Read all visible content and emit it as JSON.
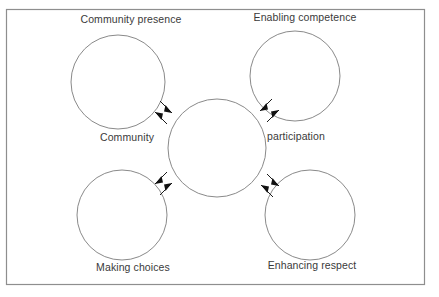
{
  "diagram": {
    "frame": {
      "name": "outer-border",
      "x": 6,
      "y": 9,
      "width": 419,
      "height": 276,
      "stroke": "#8e8e8e",
      "fill": "#ffffff"
    },
    "center_node": {
      "name": "central-circle",
      "label_left": "Community",
      "label_right": "participation",
      "cx": 217,
      "cy": 148,
      "r": 49
    },
    "nodes": [
      {
        "id": "community-presence",
        "label": "Community presence",
        "cx": 118,
        "cy": 82,
        "r": 47,
        "label_x": 118,
        "label_y": 13,
        "position": "top-left"
      },
      {
        "id": "enabling-competence",
        "label": "Enabling competence",
        "cx": 295,
        "cy": 76,
        "r": 45,
        "label_x": 305,
        "label_y": 11,
        "position": "top-right"
      },
      {
        "id": "making-choices",
        "label": "Making choices",
        "cx": 122,
        "cy": 215,
        "r": 45,
        "label_x": 133,
        "label_y": 261,
        "position": "bottom-left"
      },
      {
        "id": "enhancing-respect",
        "label": "Enhancing respect",
        "cx": 310,
        "cy": 215,
        "r": 45,
        "label_x": 312,
        "label_y": 259,
        "position": "bottom-right"
      }
    ],
    "center_labels": {
      "left": {
        "text": "Community",
        "x": 100,
        "y": 131
      },
      "right": {
        "text": "participation",
        "x": 267,
        "y": 130
      }
    },
    "connectors": [
      {
        "id": "connector-community-presence",
        "from": "central-circle",
        "to": "community-presence",
        "bidirectional": true,
        "arrow_count": 2
      },
      {
        "id": "connector-enabling-competence",
        "from": "central-circle",
        "to": "enabling-competence",
        "bidirectional": true,
        "arrow_count": 2
      },
      {
        "id": "connector-making-choices",
        "from": "central-circle",
        "to": "making-choices",
        "bidirectional": true,
        "arrow_count": 2
      },
      {
        "id": "connector-enhancing-respect",
        "from": "central-circle",
        "to": "enhancing-respect",
        "bidirectional": true,
        "arrow_count": 2
      }
    ],
    "colors": {
      "circle_stroke": "#8a8a8a",
      "frame_stroke": "#8e8e8e",
      "arrow_fill": "#111111",
      "text": "#3a3a3a",
      "background": "#ffffff"
    }
  }
}
